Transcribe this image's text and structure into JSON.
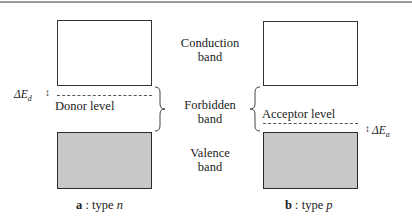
{
  "diagram": {
    "center_labels": {
      "conduction": [
        "Conduction",
        "band"
      ],
      "forbidden": [
        "Forbidden",
        "band"
      ],
      "valence": [
        "Valence",
        "band"
      ]
    },
    "panel_a": {
      "letter": "a",
      "separator": " : type ",
      "type": "n",
      "level_label": "Donor level",
      "delta_symbol": "ΔE",
      "delta_subscript": "d",
      "arrow": "↕"
    },
    "panel_b": {
      "letter": "b",
      "separator": " : type ",
      "type": "p",
      "level_label": "Acceptor level",
      "delta_symbol": "ΔE",
      "delta_subscript": "a",
      "arrow": "↕"
    },
    "colors": {
      "empty_band_fill": "#ffffff",
      "filled_band_fill": "#c8c8c8",
      "outline": "#333333",
      "top_rule": "#9a9a9a"
    }
  }
}
